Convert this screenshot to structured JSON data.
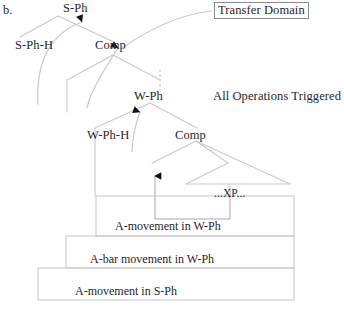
{
  "figure": {
    "caption_marker": "b.",
    "nodes": {
      "s_ph": "S-Ph",
      "s_ph_h": "S-Ph-H",
      "comp_upper": "Comp",
      "w_ph": "W-Ph",
      "w_ph_h": "W-Ph-H",
      "comp_lower": "Comp",
      "xp": "...XP..."
    },
    "annotations": {
      "transfer_domain": "Transfer Domain",
      "all_operations": "All Operations Triggered"
    },
    "domains": [
      {
        "id": "a-movement-w-ph",
        "label": "A-movement in W-Ph"
      },
      {
        "id": "a-bar-movement-w-ph",
        "label": "A-bar movement in W-Ph"
      },
      {
        "id": "a-movement-s-ph",
        "label": "A-movement in S-Ph"
      }
    ],
    "colors": {
      "tree_line": "#c9c9cd",
      "domain_box": "#c2c2c6",
      "annotation_box_border": "#8a8a90",
      "arrow_fill": "#111114",
      "text": "#26262a"
    }
  }
}
